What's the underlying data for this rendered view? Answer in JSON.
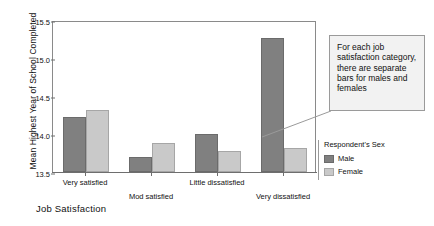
{
  "chart_data": {
    "type": "bar",
    "title": "",
    "xlabel": "Job Satisfaction",
    "ylabel": "Mean Highest Year of School Completed",
    "categories": [
      "Very satisfied",
      "Mod satisfied",
      "Little dissatisfied",
      "Very dissatisfied"
    ],
    "series": [
      {
        "name": "Male",
        "color": "#808080",
        "values": [
          14.22,
          13.7,
          14.0,
          15.26
        ]
      },
      {
        "name": "Female",
        "color": "#c9c9c9",
        "values": [
          14.32,
          13.88,
          13.78,
          13.81
        ]
      }
    ],
    "ylim": [
      13.5,
      15.5
    ],
    "yticks": [
      "13.5",
      "14.0",
      "14.5",
      "15.0",
      "15.5"
    ],
    "ytick_values": [
      13.5,
      14.0,
      14.5,
      15.0,
      15.5
    ],
    "grid": false,
    "legend_position": "right",
    "legend_title": "Respondent's Sex"
  },
  "legend": {
    "title": "Respondent's Sex",
    "items": [
      {
        "label": "Male",
        "color": "#808080"
      },
      {
        "label": "Female",
        "color": "#c9c9c9"
      }
    ]
  },
  "callout": {
    "text": "For each job satisfaction category, there are separate bars for males and females"
  },
  "colors": {
    "male": "#808080",
    "female": "#c9c9c9",
    "axis": "#6e6e6e",
    "callout_bg": "#f2f2f2",
    "callout_border": "#9a9a9a"
  }
}
